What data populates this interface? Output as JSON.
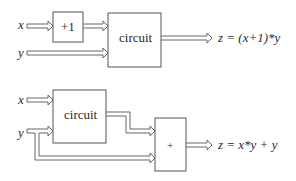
{
  "diagram_top": {
    "inputs": [
      {
        "name": "x",
        "label": "x"
      },
      {
        "name": "y",
        "label": "y"
      }
    ],
    "blocks": [
      {
        "name": "increment-block",
        "label": "+1"
      },
      {
        "name": "circuit-block",
        "label": "circuit"
      }
    ],
    "output": {
      "label": "z = (x+1)*y"
    }
  },
  "diagram_bottom": {
    "inputs": [
      {
        "name": "x",
        "label": "x"
      },
      {
        "name": "y",
        "label": "y"
      }
    ],
    "blocks": [
      {
        "name": "circuit-block",
        "label": "circuit"
      },
      {
        "name": "adder-block",
        "label": "+"
      }
    ],
    "output": {
      "label": "z = x*y + y"
    }
  },
  "colors": {
    "stroke": "#555555",
    "text": "#2a2a2a",
    "background": "#ffffff"
  }
}
